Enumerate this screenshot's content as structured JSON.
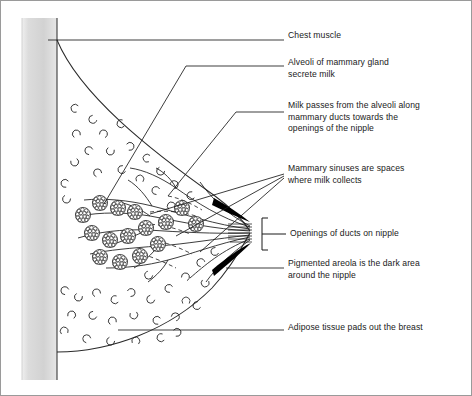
{
  "figure": {
    "border_color": "#9a9a9a",
    "background": "#ffffff",
    "ink_color": "#1a1a1a",
    "chest_wall_color": "#d8d8d8",
    "areola_color": "#000000"
  },
  "labels": [
    {
      "id": "chest-muscle",
      "text": "Chest muscle",
      "x": 288,
      "y": 35
    },
    {
      "id": "alveoli",
      "text": "Alveoli of mammary gland\nsecrete milk",
      "x": 288,
      "y": 62
    },
    {
      "id": "milk-passes",
      "text": "Milk passes from the alveoli along\nmammary ducts towards the\nopenings of the nipple",
      "x": 288,
      "y": 105
    },
    {
      "id": "mammary-sinuses",
      "text": "Mammary sinuses are spaces\nwhere milk collects",
      "x": 288,
      "y": 168
    },
    {
      "id": "duct-openings",
      "text": "Openings of ducts on nipple",
      "x": 288,
      "y": 232
    },
    {
      "id": "pigmented-areola",
      "text": "Pigmented areola is the dark area\naround the nipple",
      "x": 288,
      "y": 263
    },
    {
      "id": "adipose-tissue",
      "text": "Adipose tissue pads out the breast",
      "x": 288,
      "y": 327
    }
  ],
  "anatomy": {
    "chest_wall": {
      "x": 22,
      "width": 35,
      "top": 18,
      "bottom": 380
    },
    "nipple_tip": {
      "x": 252,
      "y": 232
    },
    "bracket": {
      "x": 262,
      "top": 218,
      "bottom": 250
    },
    "alveoli_cluster_count": 13,
    "duct_count": 11,
    "adipose_mark_count": 46
  }
}
